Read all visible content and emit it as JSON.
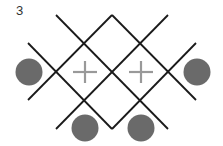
{
  "figure": {
    "label": "3",
    "width": 223,
    "height": 146
  },
  "colors": {
    "line": "#1a1a1a",
    "circle": "#6a6a6a",
    "plus": "#999999",
    "background": "#ffffff"
  },
  "lines": [
    {
      "id": "diag-down",
      "x1": 56,
      "y1": 15,
      "x2": 168,
      "y2": 129
    },
    {
      "id": "diag-up",
      "x1": 168,
      "y1": 15,
      "x2": 56,
      "y2": 129
    },
    {
      "id": "top-v-left",
      "x1": 112,
      "y1": 15,
      "x2": 28,
      "y2": 100
    },
    {
      "id": "top-v-right",
      "x1": 112,
      "y1": 15,
      "x2": 196,
      "y2": 100
    },
    {
      "id": "bottom-v-left",
      "x1": 28,
      "y1": 43,
      "x2": 112,
      "y2": 129
    },
    {
      "id": "bottom-v-right",
      "x1": 112,
      "y1": 129,
      "x2": 196,
      "y2": 43
    }
  ],
  "circles": [
    {
      "id": "left",
      "cx": 29,
      "cy": 72,
      "r": 13.5
    },
    {
      "id": "right",
      "cx": 197,
      "cy": 72,
      "r": 13.5
    },
    {
      "id": "bottom-left",
      "cx": 85,
      "cy": 128,
      "r": 13.5
    },
    {
      "id": "bottom-right",
      "cx": 141,
      "cy": 128,
      "r": 13.5
    }
  ],
  "plus_signs": [
    {
      "id": "left",
      "cx": 85,
      "cy": 72,
      "arm": 12
    },
    {
      "id": "right",
      "cx": 141,
      "cy": 72,
      "arm": 12
    }
  ]
}
